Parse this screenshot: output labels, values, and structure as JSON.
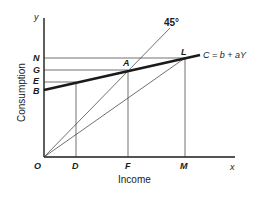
{
  "diagram": {
    "axes": {
      "x_axis_label": "Income",
      "y_axis_label": "Consumption",
      "x_end_label": "x",
      "y_end_label": "y",
      "origin_label": "O"
    },
    "y_points": [
      {
        "label": "N"
      },
      {
        "label": "G"
      },
      {
        "label": "E"
      },
      {
        "label": "B"
      }
    ],
    "x_points": [
      {
        "label": "D"
      },
      {
        "label": "F"
      },
      {
        "label": "M"
      }
    ],
    "intersection_points": [
      {
        "label": "A"
      },
      {
        "label": "L"
      }
    ],
    "lines": {
      "forty_five_label": "45°",
      "consumption_function_label": "C = b + aY"
    }
  }
}
